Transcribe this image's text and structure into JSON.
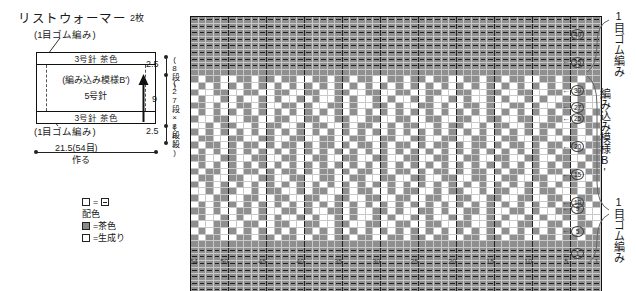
{
  "title": "リストウォーマー",
  "title_qty": "2枚",
  "schematic": {
    "rib_note_top": "(1目ゴム編み)",
    "rib_note_bottom": "(1目ゴム編み)",
    "band_top": "3号針 茶色",
    "band_bottom": "3号針 茶色",
    "mid_line1": "(編み込み模様B')",
    "mid_line2": "5号針",
    "width_label": "21.5(54目)",
    "width_sub": "作る",
    "height_top": "2.5",
    "height_top_rows": "(8段)",
    "height_mid": "9",
    "height_mid_rows": "(27段×8段)",
    "height_bot": "2.5",
    "height_bot_rows": "(8段)"
  },
  "legend": {
    "symbol_line": "=",
    "heading": "配色",
    "brown_label": "=茶色",
    "natural_label": "=生成り"
  },
  "right_labels": {
    "top": "1目ゴム編み",
    "mid": "編み込み模様B'",
    "bottom": "1目ゴム編み"
  },
  "chart_meta": {
    "column_ticks": [
      54,
      50,
      45,
      40,
      35,
      30,
      25,
      20,
      15,
      10,
      5,
      1
    ],
    "row_ticks": [
      40,
      35,
      30,
      27,
      25,
      20,
      15,
      10,
      9,
      5,
      1
    ],
    "total_columns": 54,
    "total_rows": 43,
    "colors": {
      "brown": "#8f8f8f",
      "natural": "#ffffff",
      "grid": "#c9c9c9",
      "outline": "#111111"
    }
  },
  "chart_data": {
    "type": "heatmap",
    "xlabel": "目 (stitch number, right to left 1→54)",
    "ylabel": "段 (row number, bottom to top 1→43)",
    "legend": [
      "茶色 (brown)",
      "生成り (natural)"
    ],
    "rows_top_to_bottom": [
      "RRRRRRRRRRRRRRRRRRRRRRRRRRRRRRRRRRRRRRRRRRRRRRRRRRRRRR",
      "RRRRRRRRRRRRRRRRRRRRRRRRRRRRRRRRRRRRRRRRRRRRRRRRRRRRRR",
      "RRRRRRRRRRRRRRRRRRRRRRRRRRRRRRRRRRRRRRRRRRRRRRRRRRRRRR",
      "RRRRRRRRRRRRRRRRRRRRRRRRRRRRRRRRRRRRRRRRRRRRRRRRRRRRRR",
      "RRRRRRRRRRRRRRRRRRRRRRRRRRRRRRRRRRRRRRRRRRRRRRRRRRRRRR",
      "RRRRRRRRRRRRRRRRRRRRRRRRRRRRRRRRRRRRRRRRRRRRRRRRRRRRRR",
      "RRRRRRRRRRRRRRRRRRRRRRRRRRRRRRRRRRRRRRRRRRRRRRRRRRRRRR",
      "RRRRRRRRRRRRRRRRRRRRRRRRRRRRRRRRRRRRRRRRRRRRRRRRRRRRRR",
      "BBBBBBBBBBBBBBBBBBBBBBBBBBBBBBBBBBBBBBBBBBBBBBBBBBBBBB",
      "BNBBNNBBNBBNBBNNBBNBBNBBNNBBNBBNBBNNBBNBBNBBNNBBNBBNBB",
      "NBNBNBNBNBNBNBNBNBNBNBNBNBNBNBNBNBNBNBNBNBNBNBNBNBNBNB",
      "BNNBBNNBBNNBBNNBBNNBBNNBBNNBBNNBBNNBBNNBBNNBBNNBBNNBBN",
      "NBNNBNBNNBNBNNBNBNNBNBNNBNBNNBNBNNBNBNNBNBNNBNBNNBNBNN",
      "BBNBNNBBNBNNBBNBNNBBNBNNBBNBNNBBNBNNBBNBNNBBNBNNBBNBNN",
      "NBNBNBNBNBNBNBNBNBNBNBNBNBNBNBNBNBNBNBNBNBNBNBNBNBNBNB",
      "BNNBBNNBBNNBBNNBBNNBBNNBBNNBBNNBBNNBBNNBBNNBBNNBBNNBBN",
      "NNBNBBNNBNBBNNBNBBNNBNBBNNBNBBNNBNBBNNBNBBNNBNBBNNBNBB",
      "BNBNBNBNBNBNBNBNBNBNBNBNBNBNBNBNBNBNBNBNBNBNBNBNBNBNBN",
      "NBBNNBBNNBBNNBBNNBBNNBBNNBBNNBBNNBBNNBBNNBBNNBBNNBBNNB",
      "BNBBNBNBBNBNBBNBNBBNBNBBNBNBBNBNBBNBNBBNBNBBNBNBBNBNBB",
      "NBNBNBNBNBNBNBNBNBNBNBNBNBNBNBNBNBNBNBNBNBNBNBNBNBNBNB",
      "BBNNBBNNBBNNBBNNBBNNBBNNBBNNBBNNBBNNBBNNBBNNBBNNBBNNBB",
      "NBNBNBNBNBNBNBNBNBNBNBNBNBNBNBNBNBNBNBNBNBNBNBNBNBNBNB",
      "BNBBNBNBBNBNBBNBNBBNBNBBNBNBBNBNBBNBNBBNBNBBNBNBBNBNBB",
      "NBBNNBBNNBBNNBBNNBBNNBBNNBBNNBBNNBBNNBBNNBBNNBBNNBBNNB",
      "BNBNBNBNBNBNBNBNBNBNBNBNBNBNBNBNBNBNBNBNBNBNBNBNBNBNBN",
      "NNBNBBNNBNBBNNBNBBNNBNBBNNBNBBNNBNBBNNBNBBNNBNBBNNBNBB",
      "BNNBBNNBBNNBBNNBBNNBBNNBBNNBBNNBBNNBBNNBBNNBBNNBBNNBBN",
      "NBNBNBNBNBNBNBNBNBNBNBNBNBNBNBNBNBNBNBNBNBNBNBNBNBNBNB",
      "BBNBNNBBNBNNBBNBNNBBNBNNBBNBNNBBNBNNBBNBNNBBNBNNBBNBNN",
      "NBNNBNBNNBNBNNBNBNNBNBNNBNBNNBNBNNBNBNNBNBNNBNBNNBNBNN",
      "BNNBBNNBBNNBBNNBBNNBBNNBBNNBBNNBBNNBBNNBBNNBBNNBBNNBBN",
      "NBNBNBNBNBNBNBNBNBNBNBNBNBNBNBNBNBNBNBNBNBNBNBNBNBNBNB",
      "BNBBNNBBNBBNBBNNBBNBBNBBNNBBNBBNBBNNBBNBBNBBNNBBNBBNBB",
      "BBBBBBBBBBBBBBBBBBBBBBBBBBBBBBBBBBBBBBBBBBBBBBBBBBBBBB",
      "RRRRRRRRRRRRRRRRRRRRRRRRRRRRRRRRRRRRRRRRRRRRRRRRRRRRRR",
      "RRRRRRRRRRRRRRRRRRRRRRRRRRRRRRRRRRRRRRRRRRRRRRRRRRRRRR",
      "RRRRRRRRRRRRRRRRRRRRRRRRRRRRRRRRRRRRRRRRRRRRRRRRRRRRRR",
      "RRRRRRRRRRRRRRRRRRRRRRRRRRRRRRRRRRRRRRRRRRRRRRRRRRRRRR",
      "RRRRRRRRRRRRRRRRRRRRRRRRRRRRRRRRRRRRRRRRRRRRRRRRRRRRRR",
      "RRRRRRRRRRRRRRRRRRRRRRRRRRRRRRRRRRRRRRRRRRRRRRRRRRRRRR",
      "RRRRRRRRRRRRRRRRRRRRRRRRRRRRRRRRRRRRRRRRRRRRRRRRRRRRRR",
      "RRRRRRRRRRRRRRRRRRRRRRRRRRRRRRRRRRRRRRRRRRRRRRRRRRRRRR"
    ],
    "legend_key": {
      "B": "茶色 brown",
      "N": "生成り natural",
      "R": "1目ゴム編み rib (brown)"
    }
  }
}
